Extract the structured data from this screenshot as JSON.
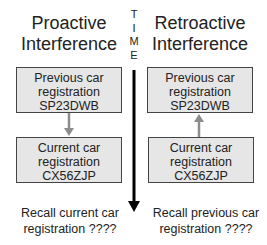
{
  "left": {
    "heading_line1": "Proactive",
    "heading_line2": "Interference",
    "top_box": {
      "line1": "Previous car",
      "line2": "registration",
      "line3": "SP23DWB"
    },
    "bottom_box": {
      "line1": "Current car",
      "line2": "registration",
      "line3": "CX56ZJP"
    },
    "arrow_direction": "down",
    "recall_line1": "Recall current car",
    "recall_line2": "registration ????"
  },
  "right": {
    "heading_line1": "Retroactive",
    "heading_line2": "Interference",
    "top_box": {
      "line1": "Previous car",
      "line2": "registration",
      "line3": "SP23DWB"
    },
    "bottom_box": {
      "line1": "Current car",
      "line2": "registration",
      "line3": "CX56ZJP"
    },
    "arrow_direction": "up",
    "recall_line1": "Recall previous car",
    "recall_line2": "registration ????"
  },
  "time_axis": {
    "letters": [
      "T",
      "I",
      "M",
      "E"
    ],
    "direction": "down"
  },
  "colors": {
    "box_fill": "#e6e6e6",
    "box_border": "#444444",
    "arrow_gray": "#8c8c8c",
    "time_line": "#000000"
  }
}
